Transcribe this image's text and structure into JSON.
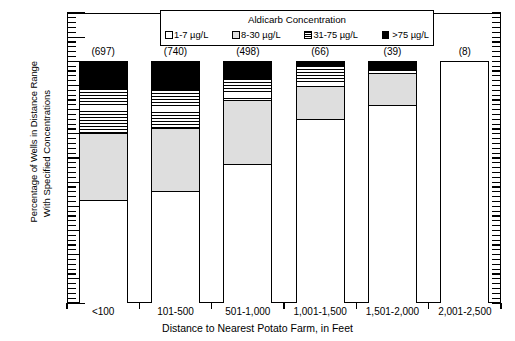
{
  "chart_data": {
    "type": "bar",
    "subtype": "stacked-bar-100-percent",
    "title": "",
    "xlabel": "Distance to Nearest Potato Farm, in Feet",
    "ylabel_line1": "Percentage of Wells in Distance Range",
    "ylabel_line2": "With Specified Concentrations",
    "ylim": [
      0,
      120
    ],
    "ytick_step": 10,
    "yticks": [
      0,
      10,
      20,
      30,
      40,
      50,
      60,
      70,
      80,
      90,
      100,
      110,
      120
    ],
    "grid": false,
    "legend_position": "inside-top-center",
    "legend_title": "Aldicarb Concentration",
    "categories": [
      "<100",
      "101-500",
      "501-1,000",
      "1,001-1,500",
      "1,501-2,000",
      "2,001-2,500"
    ],
    "bar_annotations": [
      "(697)",
      "(740)",
      "(498)",
      "(66)",
      "(39)",
      "(8)"
    ],
    "series": [
      {
        "name": "1-7 µg/L",
        "fill": "white",
        "values": [
          42.5,
          46.5,
          57.5,
          76.0,
          82.0,
          100.0
        ]
      },
      {
        "name": "8-30 µg/L",
        "fill": "gray",
        "values": [
          28.0,
          26.0,
          26.5,
          14.0,
          13.0,
          0.0
        ]
      },
      {
        "name": "31-75 µg/L",
        "fill": "hatched",
        "values": [
          18.5,
          16.0,
          9.0,
          8.5,
          2.0,
          0.0
        ]
      },
      {
        "name": ">75 µg/L",
        "fill": "black",
        "values": [
          11.0,
          11.5,
          7.0,
          1.5,
          3.0,
          0.0
        ]
      }
    ],
    "cumulative_tops": [
      [
        42.5,
        70.5,
        89.0,
        100.0
      ],
      [
        46.5,
        72.5,
        88.5,
        100.0
      ],
      [
        57.5,
        84.0,
        93.0,
        100.0
      ],
      [
        76.0,
        90.0,
        98.5,
        100.0
      ],
      [
        82.0,
        95.0,
        97.0,
        100.0
      ],
      [
        100.0,
        100.0,
        100.0,
        100.0
      ]
    ]
  },
  "colors": {
    "axis": "#000000",
    "seg_1_7": "#ffffff",
    "seg_8_30": "#dedede",
    "seg_31_75": "#ffffff",
    "seg_gt75": "#000000",
    "background": "#ffffff"
  }
}
